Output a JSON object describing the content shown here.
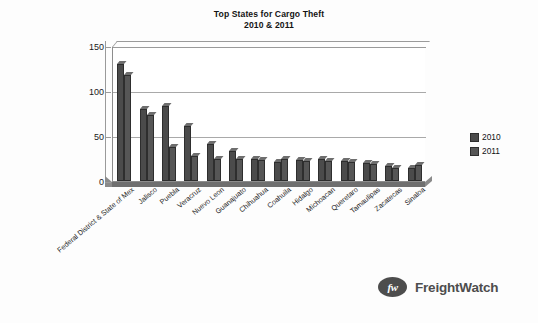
{
  "chart_data": {
    "type": "bar",
    "title": "Top States for Cargo Theft",
    "subtitle": "2010 & 2011",
    "xlabel": "",
    "ylabel": "",
    "ylim": [
      0,
      150
    ],
    "yticks": [
      0,
      50,
      100,
      150
    ],
    "grid": true,
    "legend_position": "right",
    "categories": [
      "Federal District & State of Mex",
      "Jalisco",
      "Puebla",
      "Veracruz",
      "Nuevo Leon",
      "Guanajuato",
      "Chihuahua",
      "Coahuila",
      "Hidalgo",
      "Michoacan",
      "Queretaro",
      "Tamaulipas",
      "Zacatecas",
      "Sinaloa"
    ],
    "series": [
      {
        "name": "2010",
        "color": "#4b4b4b",
        "values": [
          130,
          80,
          83,
          61,
          41,
          33,
          24,
          21,
          23,
          24,
          22,
          20,
          17,
          14
        ]
      },
      {
        "name": "2011",
        "color": "#565656",
        "values": [
          118,
          73,
          38,
          28,
          25,
          25,
          23,
          24,
          22,
          22,
          21,
          19,
          15,
          18
        ]
      }
    ]
  },
  "legend": {
    "items": [
      {
        "label": "2010"
      },
      {
        "label": "2011"
      }
    ]
  },
  "brand": {
    "mark": "fw",
    "name": "FreightWatch"
  }
}
